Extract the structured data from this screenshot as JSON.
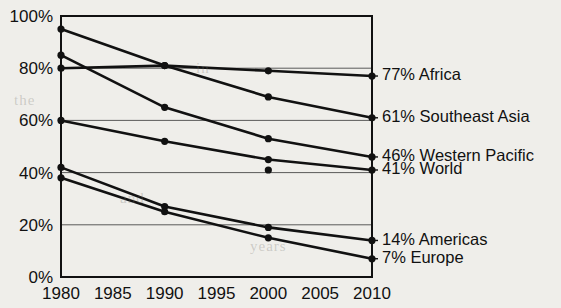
{
  "chart_data": {
    "type": "line",
    "title": "",
    "subtitle": "",
    "xlabel": "",
    "ylabel": "",
    "x": [
      1980,
      1985,
      1990,
      1995,
      2000,
      2005,
      2010
    ],
    "xtick_labels": [
      "1980",
      "1985",
      "1990",
      "1995",
      "2000",
      "2005",
      "2010"
    ],
    "xlim": [
      1980,
      2010
    ],
    "ylim": [
      0,
      100
    ],
    "ytick_labels": [
      "0%",
      "20%",
      "40%",
      "60%",
      "80%",
      "100%"
    ],
    "ytick_values": [
      0,
      20,
      40,
      60,
      80,
      100
    ],
    "yunit": "%",
    "grid": "horizontal",
    "legend_position": "right-end-labels",
    "series": [
      {
        "name": "Africa",
        "end_label": "77% Africa",
        "end_value": 77,
        "x": [
          1980,
          1990,
          2000,
          2010
        ],
        "values": [
          80,
          81,
          79,
          77
        ]
      },
      {
        "name": "Southeast Asia",
        "end_label": "61% Southeast Asia",
        "end_value": 61,
        "x": [
          1980,
          1990,
          2000,
          2010
        ],
        "values": [
          95,
          81,
          69,
          61
        ]
      },
      {
        "name": "Western Pacific",
        "end_label": "46% Western Pacific",
        "end_value": 46,
        "x": [
          1980,
          1990,
          2000,
          2010
        ],
        "values": [
          85,
          65,
          53,
          46
        ]
      },
      {
        "name": "World",
        "end_label": "41% World",
        "end_value": 41,
        "x": [
          1980,
          1990,
          2000,
          2010
        ],
        "values": [
          60,
          52,
          45,
          41
        ]
      },
      {
        "name": "Americas",
        "end_label": "14% Americas",
        "end_value": 14,
        "x": [
          1980,
          1990,
          2000,
          2010
        ],
        "values": [
          42,
          27,
          19,
          14
        ]
      },
      {
        "name": "Europe",
        "end_label": "7% Europe",
        "end_value": 7,
        "x": [
          1980,
          1990,
          2000,
          2010
        ],
        "values": [
          38,
          25,
          15,
          7
        ]
      }
    ],
    "stray_points": [
      {
        "x": 2000,
        "y": 41
      }
    ]
  },
  "ghost_text": {
    "line1": "the",
    "line2": "in",
    "line3": "and",
    "line4": "years"
  }
}
